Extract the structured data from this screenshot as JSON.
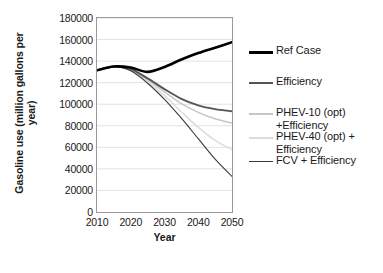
{
  "chart_data": {
    "type": "line",
    "title": "",
    "xlabel": "Year",
    "ylabel": "Gasoline use (million gallons per year)",
    "ylabel_line1": "Gasoline use (million gallons per",
    "ylabel_line2": "year)",
    "xlim": [
      2010,
      2050
    ],
    "ylim": [
      0,
      180000
    ],
    "xticks": [
      2010,
      2020,
      2030,
      2040,
      2050
    ],
    "yticks": [
      0,
      20000,
      40000,
      60000,
      80000,
      100000,
      120000,
      140000,
      160000,
      180000
    ],
    "ytick_labels": [
      "0",
      "20000",
      "40000",
      "60000",
      "80000",
      "100000",
      "120000",
      "140000",
      "160000",
      "180000"
    ],
    "xtick_labels": [
      "2010",
      "2020",
      "2030",
      "2040",
      "2050"
    ],
    "grid": true,
    "grid_axis": "y",
    "grid_color": "#e2e2e2",
    "frame_color": "#9a9a9a",
    "legend_position": "right",
    "x": [
      2010,
      2015,
      2020,
      2025,
      2030,
      2035,
      2040,
      2045,
      2050
    ],
    "series": [
      {
        "name": "Ref Case",
        "color": "#000000",
        "width": 2.6,
        "values": [
          131500,
          135000,
          134000,
          130000,
          134500,
          141500,
          147500,
          152500,
          157500
        ]
      },
      {
        "name": "Efficiency",
        "color": "#555555",
        "width": 1.9,
        "values": [
          131500,
          135000,
          132500,
          124000,
          114000,
          105000,
          99000,
          95500,
          93500
        ]
      },
      {
        "name": "PHEV-10 (opt) +Efficiency",
        "label_line1": "PHEV-10 (opt)",
        "label_line2": "+Efficiency",
        "color": "#c6c6c6",
        "width": 1.5,
        "values": [
          131500,
          135000,
          132000,
          122500,
          111500,
          100500,
          92500,
          86500,
          82500
        ]
      },
      {
        "name": "PHEV-40 (opt) + Efficiency",
        "label_line1": "PHEV-40 (opt) +",
        "label_line2": "Efficiency",
        "color": "#dcdcdc",
        "width": 1.5,
        "values": [
          131500,
          135000,
          131500,
          121000,
          108000,
          93000,
          78500,
          66500,
          58000
        ]
      },
      {
        "name": "FCV + Efficiency",
        "color": "#3a3a3a",
        "width": 1.1,
        "values": [
          131500,
          135000,
          131000,
          119500,
          104500,
          87000,
          68000,
          49000,
          33000
        ]
      }
    ]
  },
  "legend": {
    "items": [
      {
        "label": "Ref Case"
      },
      {
        "label": "Efficiency"
      },
      {
        "label": "PHEV-10 (opt)\n+Efficiency"
      },
      {
        "label": "PHEV-40 (opt) +\nEfficiency"
      },
      {
        "label": "FCV + Efficiency"
      }
    ]
  }
}
